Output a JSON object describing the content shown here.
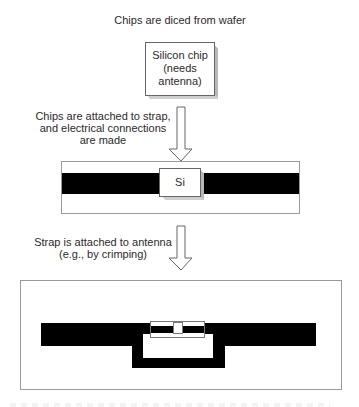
{
  "diagram": {
    "title": "Chips are diced from wafer",
    "chip_label": [
      "Silicon chip",
      "(needs",
      "antenna)"
    ],
    "step1_label": [
      "Chips are attached to strap,",
      "and electrical connections",
      "are made"
    ],
    "strap_chip_label": "Si",
    "step2_label": [
      "Strap is attached to antenna",
      "(e.g., by crimping)"
    ],
    "colors": {
      "conductor": "#000000",
      "chip_bevel": "#b8b8b8",
      "outline": "#666666",
      "background": "#ffffff"
    }
  }
}
